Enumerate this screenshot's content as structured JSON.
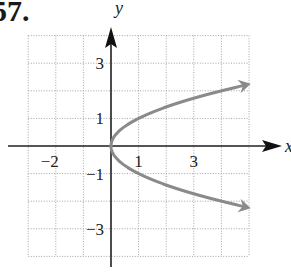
{
  "problem": {
    "number": "57."
  },
  "chart_data": {
    "type": "line",
    "title": "",
    "xlabel": "x",
    "ylabel": "y",
    "xlim": [
      -3,
      5
    ],
    "ylim": [
      -4,
      4
    ],
    "grid": true,
    "grid_style": "dotted",
    "x_ticks": [
      {
        "value": -2,
        "label": "−2"
      },
      {
        "value": 1,
        "label": "1"
      },
      {
        "value": 3,
        "label": "3"
      }
    ],
    "y_ticks": [
      {
        "value": 3,
        "label": "3"
      },
      {
        "value": 1,
        "label": "1"
      },
      {
        "value": -1,
        "label": "−1"
      },
      {
        "value": -3,
        "label": "−3"
      }
    ],
    "series": [
      {
        "name": "y = √x (upper branch)",
        "color": "#8a8a8a",
        "arrow_end": true,
        "x": [
          0,
          0.25,
          0.5,
          1,
          2,
          3,
          4,
          5
        ],
        "y": [
          0,
          0.5,
          0.71,
          1,
          1.41,
          1.73,
          2,
          2.24
        ]
      },
      {
        "name": "y = −√x (lower branch)",
        "color": "#8a8a8a",
        "arrow_end": true,
        "x": [
          0,
          0.25,
          0.5,
          1,
          2,
          3,
          4,
          5
        ],
        "y": [
          0,
          -0.5,
          -0.71,
          -1,
          -1.41,
          -1.73,
          -2,
          -2.24
        ]
      }
    ],
    "curve_equation": "x = y^2"
  }
}
